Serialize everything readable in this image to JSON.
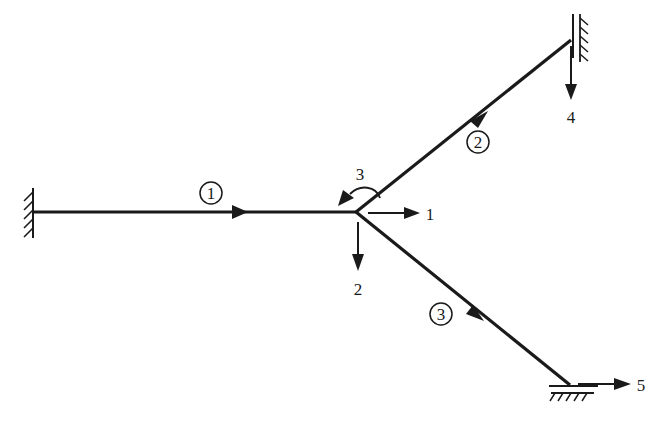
{
  "diagram": {
    "title": "",
    "type": "structural frame with three members and degrees of freedom",
    "colors": {
      "line": "#1a1a1a",
      "background": "#ffffff"
    },
    "nodes": {
      "center_joint": {
        "x": 356,
        "y": 212
      },
      "left_support": {
        "x": 34,
        "y": 212,
        "type": "fixed"
      },
      "top_right_support": {
        "x": 571,
        "y": 40,
        "type": "roller-vertical"
      },
      "bottom_right_support": {
        "x": 570,
        "y": 385,
        "type": "roller-horizontal"
      }
    },
    "members": [
      {
        "id": "1",
        "label": "1",
        "label_pos": {
          "x": 211,
          "y": 199
        }
      },
      {
        "id": "2",
        "label": "2",
        "label_pos": {
          "x": 478,
          "y": 147
        }
      },
      {
        "id": "3",
        "label": "3",
        "label_pos": {
          "x": 441,
          "y": 316
        }
      }
    ],
    "dofs": [
      {
        "id": "1",
        "label": "1",
        "direction": "horizontal-right",
        "at": "center_joint"
      },
      {
        "id": "2",
        "label": "2",
        "direction": "vertical-down",
        "at": "center_joint"
      },
      {
        "id": "3",
        "label": "3",
        "direction": "rotation",
        "at": "center_joint"
      },
      {
        "id": "4",
        "label": "4",
        "direction": "vertical-down",
        "at": "top_right_support"
      },
      {
        "id": "5",
        "label": "5",
        "direction": "horizontal-right",
        "at": "bottom_right_support"
      }
    ]
  }
}
